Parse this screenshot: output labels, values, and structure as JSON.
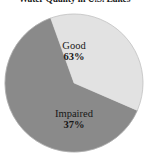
{
  "chart_data": {
    "type": "pie",
    "title": "Water Quality in U.S. Lakes",
    "xlabel": "",
    "ylabel": "",
    "categories": [
      "Good",
      "Impaired"
    ],
    "values": [
      63,
      37
    ],
    "value_labels": [
      "63%",
      "37%"
    ],
    "units": "percent",
    "legend": "none",
    "labels_position": "inside",
    "grid": false,
    "start_angle_deg": 113.4,
    "direction": "clockwise",
    "slices": [
      {
        "name": "Good",
        "value": 63,
        "value_label": "63%",
        "color": "#8a8a8a",
        "angle_deg": 226.8
      },
      {
        "name": "Impaired",
        "value": 37,
        "value_label": "37%",
        "color": "#e2e2e2",
        "angle_deg": 133.2
      }
    ],
    "geometry": {
      "center_x": 74,
      "center_y": 83,
      "radius": 69
    },
    "colors": {
      "background": "#ffffff",
      "good": "#8a8a8a",
      "impaired": "#e2e2e2",
      "text": "#171717",
      "edge": "#9a9a9a"
    }
  }
}
